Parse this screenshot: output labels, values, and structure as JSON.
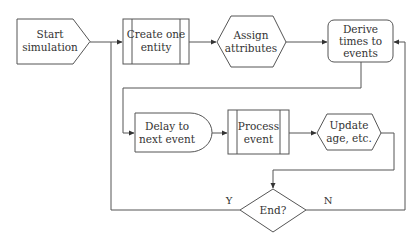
{
  "diagram": {
    "type": "flowchart",
    "nodes": {
      "start": {
        "shape": "offpage-pentagon",
        "lines": [
          "Start",
          "simulation"
        ]
      },
      "create": {
        "shape": "predefined-process",
        "lines": [
          "Create one",
          "entity"
        ]
      },
      "assign": {
        "shape": "hexagon",
        "lines": [
          "Assign",
          "attributes"
        ]
      },
      "derive": {
        "shape": "rounded-rectangle",
        "lines": [
          "Derive",
          "times to",
          "events"
        ]
      },
      "delay": {
        "shape": "delay",
        "lines": [
          "Delay to",
          "next event"
        ]
      },
      "process": {
        "shape": "predefined-process",
        "lines": [
          "Process",
          "event"
        ]
      },
      "update": {
        "shape": "hexagon",
        "lines": [
          "Update",
          "age, etc."
        ]
      },
      "end": {
        "shape": "diamond",
        "lines": [
          "End?"
        ]
      }
    },
    "edges": [
      {
        "from": "start",
        "to": "create",
        "label": ""
      },
      {
        "from": "create",
        "to": "assign",
        "label": ""
      },
      {
        "from": "assign",
        "to": "derive",
        "label": ""
      },
      {
        "from": "derive",
        "to": "delay",
        "label": ""
      },
      {
        "from": "delay",
        "to": "process",
        "label": ""
      },
      {
        "from": "process",
        "to": "update",
        "label": ""
      },
      {
        "from": "update",
        "to": "end",
        "label": ""
      },
      {
        "from": "end",
        "to": "create",
        "label": "Y"
      },
      {
        "from": "end",
        "to": "derive",
        "label": "N"
      }
    ],
    "edge_labels": {
      "yes": "Y",
      "no": "N"
    },
    "colors": {
      "stroke": "#555555",
      "text": "#333333",
      "background": "#ffffff"
    }
  }
}
